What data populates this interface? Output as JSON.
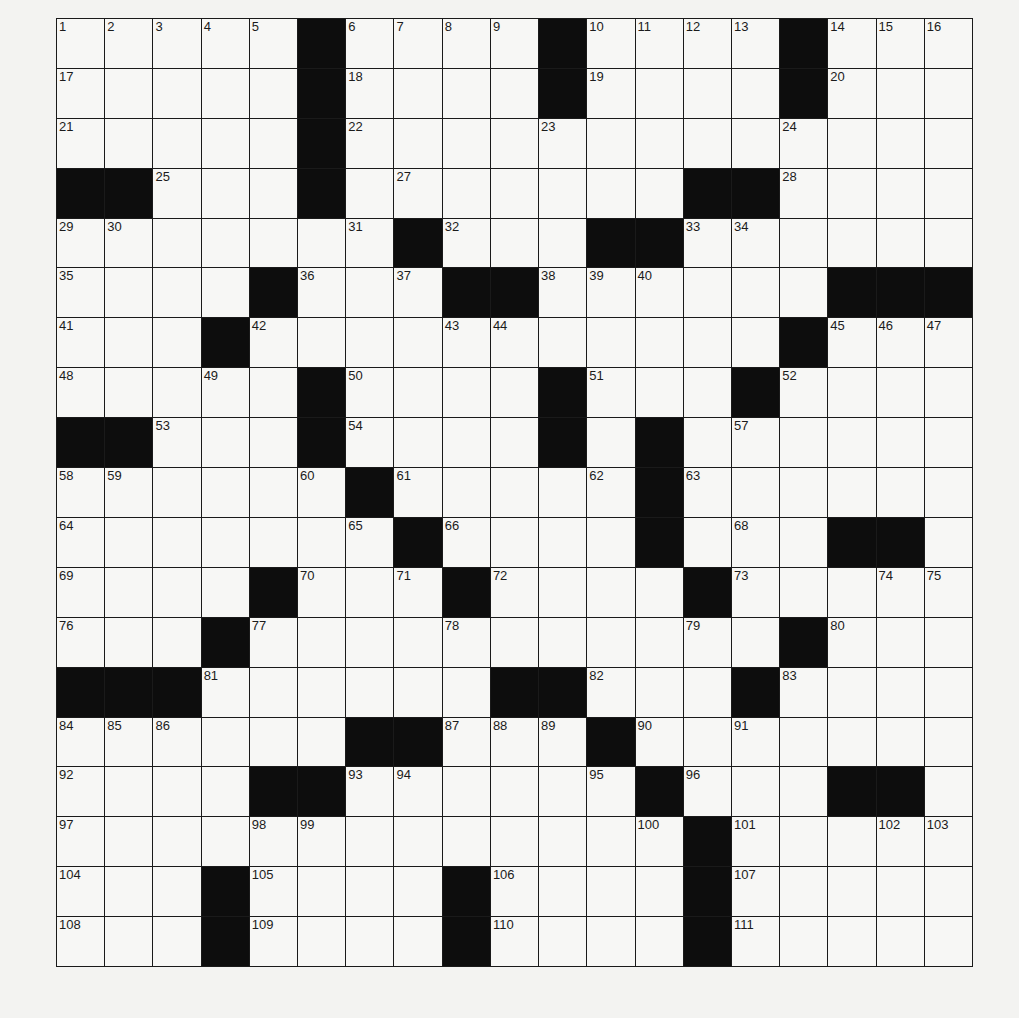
{
  "puzzle": {
    "rows": 19,
    "cols": 19,
    "layout": [
      "#####X####X####X###",
      "#####X####X####X###",
      "#####X#############",
      "XX###X#######XX####",
      "#######X###XX######",
      "####X###XX######XXX",
      "###X###########X###",
      "#####X####X###X####",
      "XX###X####X#X######",
      "######X#####X######",
      "#######X####X###XX#",
      "####X###X####X#####",
      "###X###########X###",
      "XXX######XX###X####",
      "######XX###X#######",
      "####XX######X###XX#",
      "#############X#####",
      "###X####X####X#####",
      "###X####X####X#####"
    ],
    "numbers": [
      [
        0,
        0,
        1
      ],
      [
        0,
        1,
        2
      ],
      [
        0,
        2,
        3
      ],
      [
        0,
        3,
        4
      ],
      [
        0,
        4,
        5
      ],
      [
        0,
        6,
        6
      ],
      [
        0,
        7,
        7
      ],
      [
        0,
        8,
        8
      ],
      [
        0,
        9,
        9
      ],
      [
        0,
        11,
        10
      ],
      [
        0,
        12,
        11
      ],
      [
        0,
        13,
        12
      ],
      [
        0,
        14,
        13
      ],
      [
        0,
        16,
        14
      ],
      [
        0,
        17,
        15
      ],
      [
        0,
        18,
        16
      ],
      [
        1,
        0,
        17
      ],
      [
        1,
        6,
        18
      ],
      [
        1,
        11,
        19
      ],
      [
        1,
        16,
        20
      ],
      [
        2,
        0,
        21
      ],
      [
        2,
        6,
        22
      ],
      [
        2,
        10,
        23
      ],
      [
        2,
        15,
        24
      ],
      [
        3,
        2,
        25
      ],
      [
        3,
        5,
        26
      ],
      [
        3,
        7,
        27
      ],
      [
        3,
        15,
        28
      ],
      [
        4,
        0,
        29
      ],
      [
        4,
        1,
        30
      ],
      [
        4,
        6,
        31
      ],
      [
        4,
        8,
        32
      ],
      [
        4,
        13,
        33
      ],
      [
        4,
        14,
        34
      ],
      [
        5,
        0,
        35
      ],
      [
        5,
        5,
        36
      ],
      [
        5,
        7,
        37
      ],
      [
        5,
        10,
        38
      ],
      [
        5,
        11,
        39
      ],
      [
        5,
        12,
        40
      ],
      [
        6,
        0,
        41
      ],
      [
        6,
        4,
        42
      ],
      [
        6,
        8,
        43
      ],
      [
        6,
        9,
        44
      ],
      [
        6,
        16,
        45
      ],
      [
        6,
        17,
        46
      ],
      [
        6,
        18,
        47
      ],
      [
        7,
        0,
        48
      ],
      [
        7,
        3,
        49
      ],
      [
        7,
        6,
        50
      ],
      [
        7,
        11,
        51
      ],
      [
        7,
        15,
        52
      ],
      [
        8,
        2,
        53
      ],
      [
        8,
        6,
        54
      ],
      [
        8,
        10,
        55
      ],
      [
        8,
        12,
        56
      ],
      [
        8,
        14,
        57
      ],
      [
        9,
        0,
        58
      ],
      [
        9,
        1,
        59
      ],
      [
        9,
        5,
        60
      ],
      [
        9,
        7,
        61
      ],
      [
        9,
        11,
        62
      ],
      [
        9,
        13,
        63
      ],
      [
        10,
        0,
        64
      ],
      [
        10,
        6,
        65
      ],
      [
        10,
        8,
        66
      ],
      [
        10,
        12,
        67
      ],
      [
        10,
        14,
        68
      ],
      [
        11,
        0,
        69
      ],
      [
        11,
        5,
        70
      ],
      [
        11,
        7,
        71
      ],
      [
        11,
        9,
        72
      ],
      [
        11,
        14,
        73
      ],
      [
        11,
        17,
        74
      ],
      [
        11,
        18,
        75
      ],
      [
        12,
        0,
        76
      ],
      [
        12,
        4,
        77
      ],
      [
        12,
        8,
        78
      ],
      [
        12,
        13,
        79
      ],
      [
        12,
        16,
        80
      ],
      [
        13,
        3,
        81
      ],
      [
        13,
        11,
        82
      ],
      [
        13,
        15,
        83
      ],
      [
        14,
        0,
        84
      ],
      [
        14,
        1,
        85
      ],
      [
        14,
        2,
        86
      ],
      [
        14,
        8,
        87
      ],
      [
        14,
        9,
        88
      ],
      [
        14,
        10,
        89
      ],
      [
        14,
        12,
        90
      ],
      [
        14,
        14,
        91
      ],
      [
        15,
        0,
        92
      ],
      [
        15,
        6,
        93
      ],
      [
        15,
        7,
        94
      ],
      [
        15,
        11,
        95
      ],
      [
        15,
        13,
        96
      ],
      [
        16,
        0,
        97
      ],
      [
        16,
        4,
        98
      ],
      [
        16,
        5,
        99
      ],
      [
        16,
        12,
        100
      ],
      [
        16,
        14,
        101
      ],
      [
        16,
        17,
        102
      ],
      [
        16,
        18,
        103
      ],
      [
        17,
        0,
        104
      ],
      [
        17,
        4,
        105
      ],
      [
        17,
        9,
        106
      ],
      [
        17,
        14,
        107
      ],
      [
        18,
        0,
        108
      ],
      [
        18,
        4,
        109
      ],
      [
        18,
        9,
        110
      ],
      [
        18,
        14,
        111
      ]
    ]
  },
  "colors": {
    "page_bg": "#f3f3f1",
    "cell_bg": "#f7f7f5",
    "block": "#0d0d0d",
    "grid_line": "#1a1a1a"
  }
}
